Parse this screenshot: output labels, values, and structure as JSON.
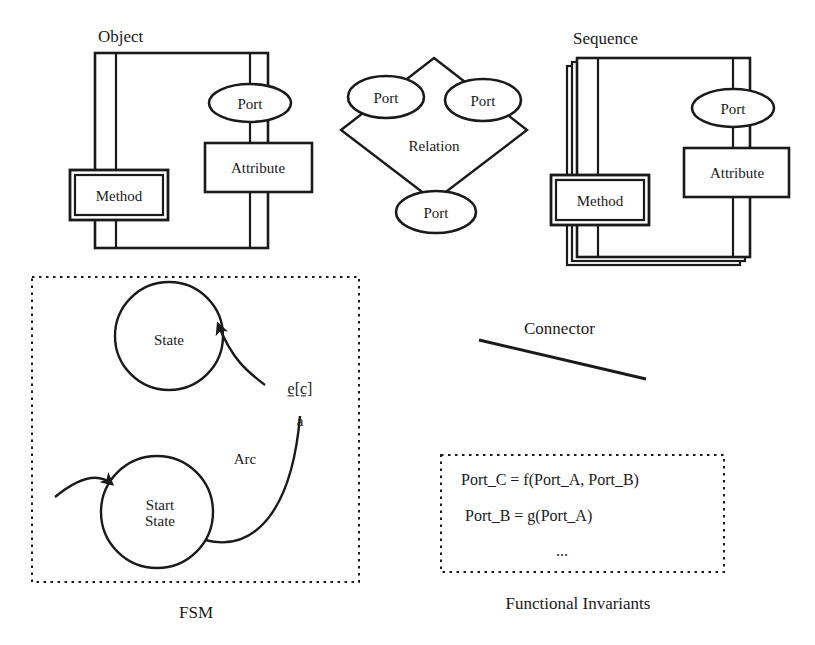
{
  "figure": {
    "stroke_color": "#1a1a1a",
    "fill_color": "#ffffff",
    "background": "#ffffff"
  },
  "object_group": {
    "title": "Object",
    "body_label": "",
    "method": "Method",
    "port": "Port",
    "attribute": "Attribute"
  },
  "relation_group": {
    "title": "Relation",
    "port_left": "Port",
    "port_right": "Port",
    "port_bottom": "Port"
  },
  "sequence_group": {
    "title": "Sequence",
    "method": "Method",
    "port": "Port",
    "attribute": "Attribute"
  },
  "connector_group": {
    "label": "Connector"
  },
  "fsm_group": {
    "caption": "FSM",
    "state": "State",
    "start_state_line1": "Start",
    "start_state_line2": "State",
    "arc_label": "Arc",
    "event_condition": "e[c]",
    "action": "a"
  },
  "invariants_group": {
    "caption": "Functional Invariants",
    "lines": [
      "Port_C = f(Port_A, Port_B)",
      "Port_B = g(Port_A)",
      "..."
    ]
  }
}
